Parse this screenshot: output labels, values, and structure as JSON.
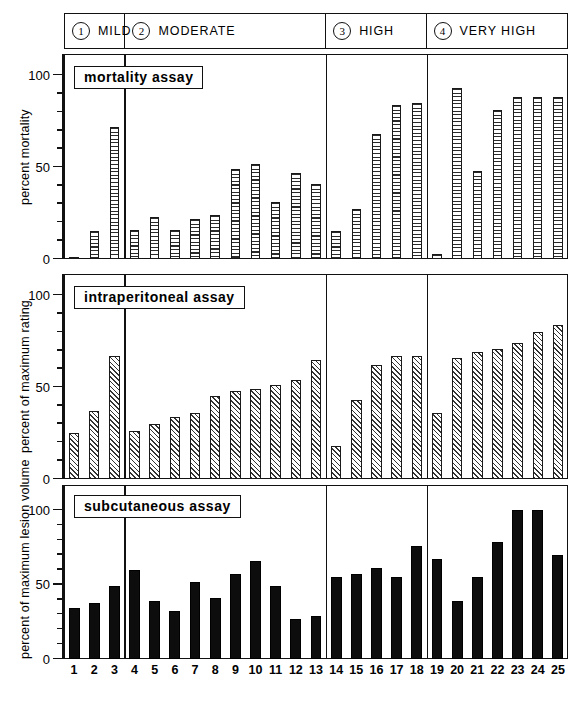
{
  "figure": {
    "severity_header": [
      {
        "number": "1",
        "label": "MILD"
      },
      {
        "number": "2",
        "label": "MODERATE"
      },
      {
        "number": "3",
        "label": "HIGH"
      },
      {
        "number": "4",
        "label": "VERY HIGH"
      }
    ],
    "panels": [
      {
        "id": "mortality",
        "caption": "mortality assay",
        "ylabel": "percent mortality",
        "tick_labels": [
          "0",
          "50",
          "100"
        ]
      },
      {
        "id": "intraperitoneal",
        "caption": "intraperitoneal assay",
        "ylabel": "percent of maximum rating",
        "tick_labels": [
          "0",
          "50",
          "100"
        ]
      },
      {
        "id": "subcutaneous",
        "caption": "subcutaneous assay",
        "ylabel": "percent of maximum lesion volume",
        "tick_labels": [
          "0",
          "50",
          "100"
        ]
      }
    ],
    "x_tick_labels": [
      "1",
      "2",
      "3",
      "4",
      "5",
      "6",
      "7",
      "8",
      "9",
      "10",
      "11",
      "12",
      "13",
      "14",
      "15",
      "16",
      "17",
      "18",
      "19",
      "20",
      "21",
      "22",
      "23",
      "24",
      "25"
    ],
    "colors": {
      "ink": "#111111",
      "solid_bar": "#0d0d0d",
      "hatch_line": "#2b2b2b",
      "background": "#ffffff"
    }
  },
  "chart_data": [
    {
      "type": "bar",
      "title": "mortality assay",
      "xlabel": "",
      "ylabel": "percent mortality",
      "ylim": [
        0,
        110
      ],
      "yticks": [
        0,
        10,
        20,
        30,
        40,
        50,
        60,
        70,
        80,
        90,
        100
      ],
      "ytick_labels": [
        "0",
        "50",
        "100"
      ],
      "grid": false,
      "legend": "none",
      "bar_style": "horizontal-hatch",
      "categories": [
        "1",
        "2",
        "3",
        "4",
        "5",
        "6",
        "7",
        "8",
        "9",
        "10",
        "11",
        "12",
        "13",
        "14",
        "15",
        "16",
        "17",
        "18",
        "19",
        "20",
        "21",
        "22",
        "23",
        "24",
        "25"
      ],
      "values": [
        1,
        15,
        72,
        16,
        23,
        16,
        22,
        24,
        49,
        52,
        31,
        47,
        41,
        15,
        27,
        68,
        84,
        85,
        3,
        93,
        48,
        81,
        88,
        88,
        88
      ],
      "groups": [
        {
          "label": "MILD",
          "number": "1",
          "categories": [
            "1",
            "2",
            "3"
          ]
        },
        {
          "label": "MODERATE",
          "number": "2",
          "categories": [
            "4",
            "5",
            "6",
            "7",
            "8",
            "9",
            "10",
            "11",
            "12",
            "13"
          ]
        },
        {
          "label": "HIGH",
          "number": "3",
          "categories": [
            "14",
            "15",
            "16",
            "17",
            "18"
          ]
        },
        {
          "label": "VERY HIGH",
          "number": "4",
          "categories": [
            "19",
            "20",
            "21",
            "22",
            "23",
            "24",
            "25"
          ]
        }
      ]
    },
    {
      "type": "bar",
      "title": "intraperitoneal assay",
      "xlabel": "",
      "ylabel": "percent of maximum rating",
      "ylim": [
        0,
        110
      ],
      "yticks": [
        0,
        10,
        20,
        30,
        40,
        50,
        60,
        70,
        80,
        90,
        100
      ],
      "ytick_labels": [
        "0",
        "50",
        "100"
      ],
      "grid": false,
      "legend": "none",
      "bar_style": "diagonal-hatch",
      "categories": [
        "1",
        "2",
        "3",
        "4",
        "5",
        "6",
        "7",
        "8",
        "9",
        "10",
        "11",
        "12",
        "13",
        "14",
        "15",
        "16",
        "17",
        "18",
        "19",
        "20",
        "21",
        "22",
        "23",
        "24",
        "25"
      ],
      "values": [
        25,
        37,
        67,
        26,
        30,
        34,
        36,
        45,
        48,
        49,
        51,
        54,
        65,
        18,
        43,
        62,
        67,
        67,
        36,
        66,
        69,
        71,
        74,
        80,
        84
      ],
      "groups": [
        {
          "label": "MILD",
          "number": "1",
          "categories": [
            "1",
            "2",
            "3"
          ]
        },
        {
          "label": "MODERATE",
          "number": "2",
          "categories": [
            "4",
            "5",
            "6",
            "7",
            "8",
            "9",
            "10",
            "11",
            "12",
            "13"
          ]
        },
        {
          "label": "HIGH",
          "number": "3",
          "categories": [
            "14",
            "15",
            "16",
            "17",
            "18"
          ]
        },
        {
          "label": "VERY HIGH",
          "number": "4",
          "categories": [
            "19",
            "20",
            "21",
            "22",
            "23",
            "24",
            "25"
          ]
        }
      ]
    },
    {
      "type": "bar",
      "title": "subcutaneous assay",
      "xlabel": "",
      "ylabel": "percent of maximum lesion volume",
      "ylim": [
        0,
        115
      ],
      "yticks": [
        0,
        10,
        20,
        30,
        40,
        50,
        60,
        70,
        80,
        90,
        100
      ],
      "ytick_labels": [
        "0",
        "50",
        "100"
      ],
      "grid": false,
      "legend": "none",
      "bar_style": "solid",
      "categories": [
        "1",
        "2",
        "3",
        "4",
        "5",
        "6",
        "7",
        "8",
        "9",
        "10",
        "11",
        "12",
        "13",
        "14",
        "15",
        "16",
        "17",
        "18",
        "19",
        "20",
        "21",
        "22",
        "23",
        "24",
        "25"
      ],
      "values": [
        34,
        38,
        49,
        60,
        39,
        32,
        52,
        41,
        57,
        66,
        49,
        27,
        29,
        55,
        57,
        61,
        55,
        76,
        67,
        39,
        55,
        79,
        100,
        100,
        70
      ],
      "groups": [
        {
          "label": "MILD",
          "number": "1",
          "categories": [
            "1",
            "2",
            "3"
          ]
        },
        {
          "label": "MODERATE",
          "number": "2",
          "categories": [
            "4",
            "5",
            "6",
            "7",
            "8",
            "9",
            "10",
            "11",
            "12",
            "13"
          ]
        },
        {
          "label": "HIGH",
          "number": "3",
          "categories": [
            "14",
            "15",
            "16",
            "17",
            "18"
          ]
        },
        {
          "label": "VERY HIGH",
          "number": "4",
          "categories": [
            "19",
            "20",
            "21",
            "22",
            "23",
            "24",
            "25"
          ]
        }
      ]
    }
  ]
}
